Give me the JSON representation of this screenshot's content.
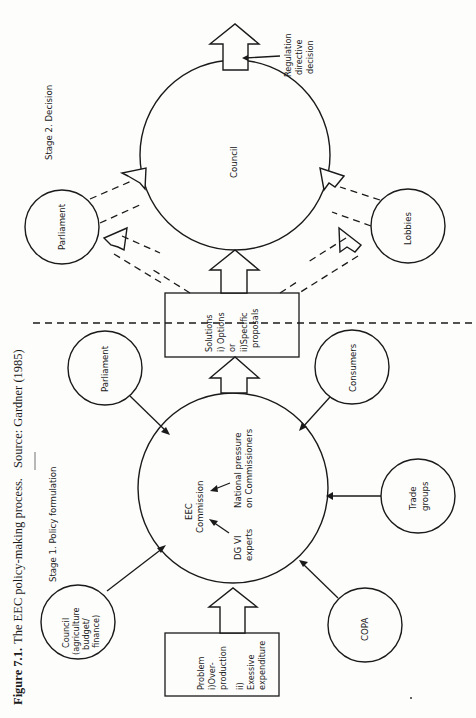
{
  "figure": {
    "orientation": "rotated 90 degrees counter-clockwise",
    "caption_label": "Figure 7.1.",
    "caption_text": "The EEC policy-making process.",
    "caption_source": "Source: Gardner (1985)"
  },
  "stages": {
    "stage1": "Stage 1. Policy formulation",
    "stage2": "Stage 2. Decision"
  },
  "nodes": {
    "commission": {
      "line1": "EEC",
      "line2": "Commission",
      "experts_line1": "DG VI",
      "experts_line2": "experts",
      "pressure_line1": "National pressure",
      "pressure_line2": "on Commissioners"
    },
    "council_stage1": {
      "lines": [
        "Council",
        "(agriculture",
        "budget/",
        "finance)"
      ]
    },
    "parliament_stage1": {
      "label": "Parliament"
    },
    "consumers": {
      "label": "Consumers"
    },
    "trade_groups": {
      "lines": [
        "Trade",
        "groups"
      ]
    },
    "copa": {
      "label": "COPA"
    },
    "council_stage2": {
      "label": "Council"
    },
    "parliament_stage2": {
      "label": "Parliament"
    },
    "lobbies": {
      "label": "Lobbies"
    }
  },
  "boxes": {
    "problem": {
      "lines": [
        "Problem",
        "i)Over-",
        "production",
        "ii)",
        "Exessive",
        "expenditure"
      ]
    },
    "solutions": {
      "lines": [
        "Solutions",
        "i) Options",
        "or",
        "ii)Specific",
        "proposals"
      ]
    }
  },
  "output": {
    "lines": [
      "Regulation",
      "directive",
      "decision"
    ]
  },
  "colors": {
    "ink": "#1a1a1a",
    "paper": "#fdfdfc"
  }
}
